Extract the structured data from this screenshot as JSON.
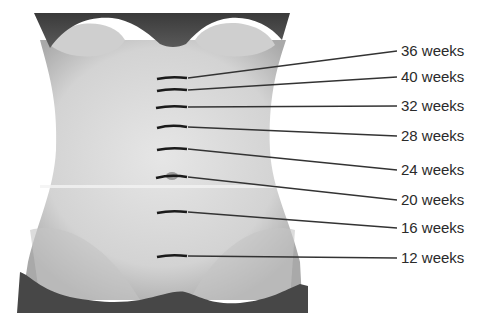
{
  "figure": {
    "markers": [
      {
        "label": "36 weeks",
        "marker_y": 78,
        "label_y": 51
      },
      {
        "label": "40 weeks",
        "marker_y": 90,
        "label_y": 77
      },
      {
        "label": "32 weeks",
        "marker_y": 107,
        "label_y": 106
      },
      {
        "label": "28 weeks",
        "marker_y": 126,
        "label_y": 136
      },
      {
        "label": "24 weeks",
        "marker_y": 149,
        "label_y": 170
      },
      {
        "label": "20 weeks",
        "marker_y": 177,
        "label_y": 200
      },
      {
        "label": "16 weeks",
        "marker_y": 212,
        "label_y": 228
      },
      {
        "label": "12 weeks",
        "marker_y": 256,
        "label_y": 258
      }
    ],
    "colors": {
      "background": "#ffffff",
      "skin": "#d9d9d9",
      "skin_shadow": "#b5b5b5",
      "garment": "#4a4a4a",
      "marker": "#1a1a1a",
      "leader_line": "#333333",
      "text": "#2a2a2a"
    }
  }
}
